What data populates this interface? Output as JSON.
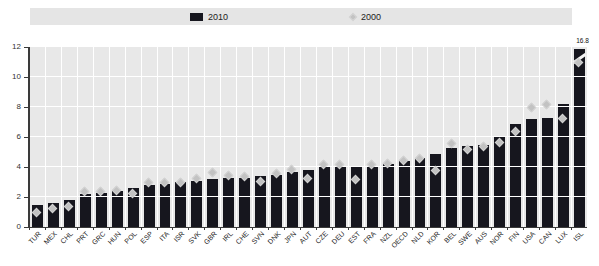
{
  "legend": {
    "series_2010": "2010",
    "series_2000": "2000"
  },
  "annotation": {
    "isl_value_label": "16.8"
  },
  "colors": {
    "bar": "#16161e",
    "diamond": "#c2c2c2",
    "plot_background": "#e8e8e8",
    "legend_background": "#e5e5e5",
    "gridline": "#ffffff",
    "axis": "#3a3a3a"
  },
  "chart_data": {
    "type": "bar",
    "title": "",
    "xlabel": "",
    "ylabel": "",
    "ylim": [
      0,
      12
    ],
    "yticks": [
      0,
      2,
      4,
      6,
      8,
      10,
      12
    ],
    "grid": true,
    "legend_position": "top",
    "categories": [
      "TUR",
      "MEX",
      "CHL",
      "PRT",
      "GRC",
      "HUN",
      "POL",
      "ESP",
      "ITA",
      "ISR",
      "SVK",
      "GBR",
      "IRL",
      "CHE",
      "SVN",
      "DNK",
      "JPN",
      "AUT",
      "CZE",
      "DEU",
      "EST",
      "FRA",
      "NZL",
      "OECD",
      "NLD",
      "KOR",
      "BEL",
      "SWE",
      "AUS",
      "NOR",
      "FIN",
      "USA",
      "CAN",
      "LUX",
      "ISL"
    ],
    "series": [
      {
        "name": "2010",
        "type": "bar",
        "values": [
          1.5,
          1.6,
          1.8,
          2.2,
          2.3,
          2.4,
          2.6,
          2.8,
          2.9,
          3.0,
          3.1,
          3.2,
          3.3,
          3.3,
          3.4,
          3.5,
          3.7,
          3.8,
          4.0,
          4.0,
          4.1,
          4.1,
          4.2,
          4.4,
          4.6,
          4.9,
          5.3,
          5.4,
          5.5,
          6.1,
          6.9,
          7.2,
          7.3,
          8.2,
          16.8
        ]
      },
      {
        "name": "2000",
        "type": "scatter-diamond",
        "values": [
          1.0,
          1.3,
          1.4,
          2.4,
          2.4,
          2.5,
          2.3,
          3.0,
          3.0,
          3.0,
          3.3,
          3.7,
          3.5,
          3.4,
          3.1,
          3.6,
          3.9,
          3.3,
          4.2,
          4.2,
          3.2,
          4.2,
          4.3,
          4.5,
          4.6,
          3.8,
          5.6,
          5.2,
          5.4,
          5.7,
          6.4,
          8.0,
          8.2,
          7.3,
          11.0
        ]
      }
    ],
    "truncated_bar": {
      "category": "ISL",
      "actual_value": 16.8,
      "display_cap": 11.9
    }
  }
}
